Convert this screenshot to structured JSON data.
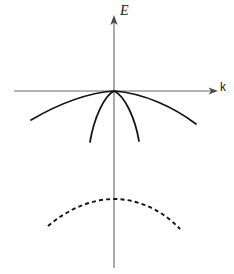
{
  "figure": {
    "background_color": "#ffffff",
    "width": 234,
    "height": 274
  },
  "axes": {
    "vertical": {
      "label": "E",
      "name": "energy-axis",
      "color": "#6b6b6b",
      "x": 114,
      "y_top": 18,
      "y_bottom": 268,
      "arrow": "up"
    },
    "horizontal": {
      "label": "k",
      "name": "wavevector-axis",
      "color": "#6b6b6b",
      "y": 91,
      "x_left": 14,
      "x_right": 216,
      "arrow": "right"
    },
    "origin": {
      "x": 114,
      "y": 91
    }
  },
  "chart_data": {
    "type": "line",
    "title": "",
    "xlabel": "k",
    "ylabel": "E",
    "grid": false,
    "legend": null,
    "origin": {
      "x": 0,
      "y": 0
    },
    "series": [
      {
        "name": "heavy-hole-band",
        "style": "solid",
        "color": "#141414",
        "description": "wide shallow downward parabola through origin",
        "path": "M 31 120 C 55 106, 86 93, 114 91 C 144 93, 175 108, 196 124",
        "points": [
          {
            "x": 31,
            "y": 120
          },
          {
            "x": 58,
            "y": 106
          },
          {
            "x": 86,
            "y": 96
          },
          {
            "x": 114,
            "y": 91
          },
          {
            "x": 142,
            "y": 96
          },
          {
            "x": 170,
            "y": 108
          },
          {
            "x": 196,
            "y": 124
          }
        ]
      },
      {
        "name": "light-hole-band",
        "style": "solid",
        "color": "#141414",
        "description": "narrow steep downward parabola through origin",
        "path": "M 90 142 C 94 118, 104 96, 114 91 C 125 96, 135 118, 139 141",
        "points": [
          {
            "x": 90,
            "y": 142
          },
          {
            "x": 97,
            "y": 119
          },
          {
            "x": 105,
            "y": 101
          },
          {
            "x": 114,
            "y": 91
          },
          {
            "x": 124,
            "y": 101
          },
          {
            "x": 133,
            "y": 119
          },
          {
            "x": 139,
            "y": 141
          }
        ]
      },
      {
        "name": "split-off-band",
        "style": "dashed",
        "color": "#141414",
        "dash_pattern": [
          4,
          3.2
        ],
        "description": "dashed downward parabola below the k axis, peak on E axis",
        "path": "M 48 226 C 68 209, 92 199, 114 199 C 140 199, 164 212, 180 229",
        "points": [
          {
            "x": 48,
            "y": 226
          },
          {
            "x": 70,
            "y": 209
          },
          {
            "x": 92,
            "y": 200
          },
          {
            "x": 114,
            "y": 199
          },
          {
            "x": 140,
            "y": 203
          },
          {
            "x": 162,
            "y": 213
          },
          {
            "x": 180,
            "y": 229
          }
        ]
      }
    ]
  }
}
